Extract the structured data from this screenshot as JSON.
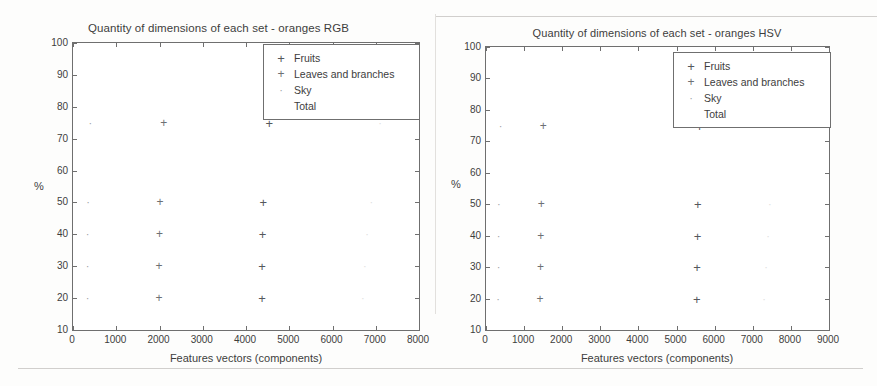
{
  "figures": [
    {
      "id": "rgb",
      "title": "Quantity of dimensions of each set - oranges RGB",
      "xlabel": "Features vectors (components)",
      "ylabel": "%"
    },
    {
      "id": "hsv",
      "title": "Quantity of dimensions of each set - oranges HSV",
      "xlabel": "Features vectors (components)",
      "ylabel": "%"
    }
  ],
  "legend": {
    "entries": [
      {
        "label": "Fruits",
        "marker": "plus",
        "marker_glyph": "+",
        "class": "m-fruits"
      },
      {
        "label": "Leaves and branches",
        "marker": "plus",
        "marker_glyph": "+",
        "class": "m-leaves"
      },
      {
        "label": "Sky",
        "marker": "dot",
        "marker_glyph": "·",
        "class": "m-sky"
      },
      {
        "label": "Total",
        "marker": "none",
        "marker_glyph": "",
        "class": "m-total"
      }
    ]
  },
  "chart_data": [
    {
      "type": "scatter",
      "title": "Quantity of dimensions of each set - oranges RGB",
      "xlabel": "Features vectors (components)",
      "ylabel": "%",
      "xlim": [
        0,
        8000
      ],
      "ylim": [
        10,
        100
      ],
      "xticks": [
        0,
        1000,
        2000,
        3000,
        4000,
        5000,
        6000,
        7000,
        8000
      ],
      "yticks": [
        10,
        20,
        30,
        40,
        50,
        60,
        70,
        80,
        90,
        100
      ],
      "grid": false,
      "legend_position": "upper right",
      "series": [
        {
          "name": "Sky",
          "marker": "dot",
          "points": [
            {
              "x": 340,
              "y": 20
            },
            {
              "x": 340,
              "y": 30
            },
            {
              "x": 340,
              "y": 40
            },
            {
              "x": 350,
              "y": 50
            },
            {
              "x": 400,
              "y": 75
            }
          ]
        },
        {
          "name": "Leaves and branches",
          "marker": "plus",
          "points": [
            {
              "x": 1990,
              "y": 20
            },
            {
              "x": 1990,
              "y": 30
            },
            {
              "x": 2000,
              "y": 40
            },
            {
              "x": 2010,
              "y": 50
            },
            {
              "x": 2100,
              "y": 75
            }
          ]
        },
        {
          "name": "Fruits",
          "marker": "plus",
          "points": [
            {
              "x": 4370,
              "y": 20
            },
            {
              "x": 4370,
              "y": 30
            },
            {
              "x": 4380,
              "y": 40
            },
            {
              "x": 4400,
              "y": 50
            },
            {
              "x": 4540,
              "y": 75
            }
          ]
        },
        {
          "name": "Total",
          "marker": "none",
          "points": [
            {
              "x": 6700,
              "y": 20
            },
            {
              "x": 6750,
              "y": 30
            },
            {
              "x": 6800,
              "y": 40
            },
            {
              "x": 6900,
              "y": 50
            },
            {
              "x": 7100,
              "y": 75
            }
          ]
        }
      ]
    },
    {
      "type": "scatter",
      "title": "Quantity of dimensions of each set - oranges HSV",
      "xlabel": "Features vectors (components)",
      "ylabel": "%",
      "xlim": [
        0,
        9000
      ],
      "ylim": [
        10,
        100
      ],
      "xticks": [
        0,
        1000,
        2000,
        3000,
        4000,
        5000,
        6000,
        7000,
        8000,
        9000
      ],
      "yticks": [
        10,
        20,
        30,
        40,
        50,
        60,
        70,
        80,
        90,
        100
      ],
      "grid": false,
      "legend_position": "upper right",
      "series": [
        {
          "name": "Sky",
          "marker": "dot",
          "points": [
            {
              "x": 320,
              "y": 20
            },
            {
              "x": 330,
              "y": 30
            },
            {
              "x": 330,
              "y": 40
            },
            {
              "x": 340,
              "y": 50
            },
            {
              "x": 380,
              "y": 75
            }
          ]
        },
        {
          "name": "Leaves and branches",
          "marker": "plus",
          "points": [
            {
              "x": 1420,
              "y": 20
            },
            {
              "x": 1430,
              "y": 30
            },
            {
              "x": 1440,
              "y": 40
            },
            {
              "x": 1450,
              "y": 50
            },
            {
              "x": 1500,
              "y": 75
            }
          ]
        },
        {
          "name": "Fruits",
          "marker": "plus",
          "points": [
            {
              "x": 5530,
              "y": 20
            },
            {
              "x": 5540,
              "y": 30
            },
            {
              "x": 5550,
              "y": 40
            },
            {
              "x": 5560,
              "y": 50
            },
            {
              "x": 5600,
              "y": 75
            }
          ]
        },
        {
          "name": "Total",
          "marker": "none",
          "points": [
            {
              "x": 7300,
              "y": 20
            },
            {
              "x": 7350,
              "y": 30
            },
            {
              "x": 7400,
              "y": 40
            },
            {
              "x": 7450,
              "y": 50
            },
            {
              "x": 7500,
              "y": 75
            }
          ]
        }
      ]
    }
  ]
}
